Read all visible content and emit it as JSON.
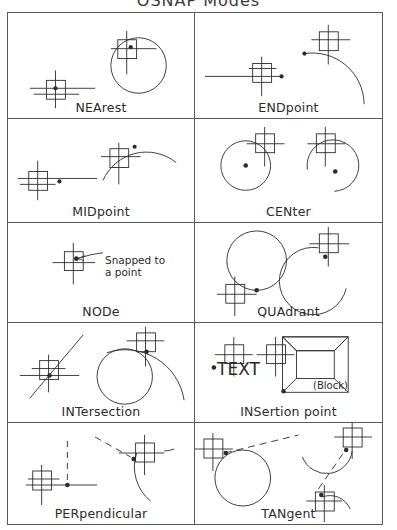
{
  "title": "OSNAP  Modes",
  "grid": {
    "columns": 2,
    "rows": 5,
    "cells": [
      {
        "id": "nearest",
        "label": "NEArest",
        "row": 1,
        "col": 1,
        "description": "Crosshair aperture snapping to nearest point on a line and on a circle"
      },
      {
        "id": "endpoint",
        "label": "ENDpoint",
        "row": 1,
        "col": 2,
        "description": "Crosshair aperture snapping to the end point of a line and of an arc"
      },
      {
        "id": "midpoint",
        "label": "MIDpoint",
        "row": 2,
        "col": 1,
        "description": "Crosshair aperture snapping to the middle point of a line and of an arc"
      },
      {
        "id": "center",
        "label": "CENter",
        "row": 2,
        "col": 2,
        "description": "Crosshair aperture on circle edge snapping to the center of a circle and of an arc"
      },
      {
        "id": "node",
        "label": "NODe",
        "row": 3,
        "col": 1,
        "description": "Crosshair aperture snapping to a drawn point entity",
        "annotation": "Snapped to\na point"
      },
      {
        "id": "quadrant",
        "label": "QUAdrant",
        "row": 3,
        "col": 2,
        "description": "Crosshair aperture snapping to a quadrant point of a circle and of an arc"
      },
      {
        "id": "intersection",
        "label": "INTersection",
        "row": 4,
        "col": 1,
        "description": "Crosshair aperture snapping to the intersection of two lines and of a circle with an arc"
      },
      {
        "id": "insertion",
        "label": "INSertion point",
        "row": 4,
        "col": 2,
        "description": "Crosshair aperture snapping to the insertion point of text and of a block",
        "text_sample": "TEXT",
        "block_caption": "(Block)"
      },
      {
        "id": "perpendicular",
        "label": "PERpendicular",
        "row": 5,
        "col": 1,
        "description": "Crosshair aperture snapping perpendicular to a line and to an arc"
      },
      {
        "id": "tangent",
        "label": "TANgent",
        "row": 5,
        "col": 2,
        "description": "Crosshair aperture snapping tangent to a circle and to arcs"
      }
    ]
  },
  "colors": {
    "ink": "#2b2b2b",
    "frame": "#5a5a5a",
    "background": "#ffffff",
    "title": "#3a3a3a"
  }
}
